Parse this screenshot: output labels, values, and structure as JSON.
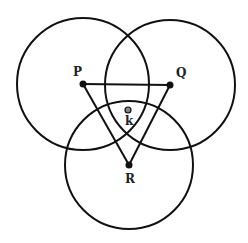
{
  "diagram": {
    "type": "geometry",
    "colors": {
      "stroke": "#111111",
      "background": "#ffffff",
      "k_point_fill": "#888888"
    },
    "points": {
      "P": {
        "label": "P",
        "x": 83,
        "y": 84
      },
      "Q": {
        "label": "Q",
        "x": 170,
        "y": 85
      },
      "R": {
        "label": "R",
        "x": 129,
        "y": 165
      },
      "k": {
        "label": "k",
        "x": 128,
        "y": 110
      }
    },
    "circles": [
      {
        "center": "P",
        "r": 66
      },
      {
        "center": "Q",
        "r": 65
      },
      {
        "center": "R",
        "r": 64
      }
    ],
    "triangle": [
      "P",
      "Q",
      "R"
    ]
  }
}
